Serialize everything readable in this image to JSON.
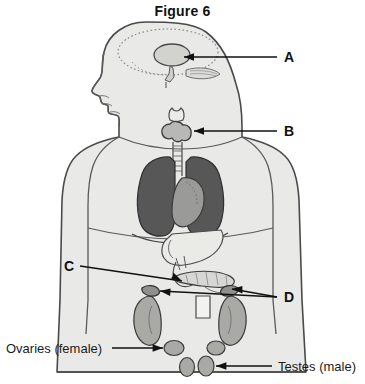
{
  "figure": {
    "title": "Figure 6"
  },
  "labels": {
    "a": {
      "text": "A",
      "target": "pituitary-gland"
    },
    "b": {
      "text": "B",
      "target": "thyroid-gland"
    },
    "c": {
      "text": "C",
      "target": "pancreas"
    },
    "d": {
      "text": "D",
      "target": "adrenal-glands"
    },
    "ovaries": {
      "text": "Ovaries (female)",
      "target": "ovaries"
    },
    "testes": {
      "text": "Testes (male)",
      "target": "testes"
    }
  },
  "colors": {
    "background": "#ffffff",
    "body_fill": "#e9e9e7",
    "body_stroke": "#4a4a4a",
    "organ_light": "#d7d7d4",
    "organ_mid": "#a9a9a6",
    "lung_dark": "#575757",
    "heart_gray": "#9a9a98",
    "line": "#111111",
    "text": "#1a1a1a"
  },
  "organs": [
    {
      "name": "brain-outline",
      "label_ref": null
    },
    {
      "name": "pituitary-gland",
      "label_ref": "A"
    },
    {
      "name": "hypothalamus",
      "label_ref": null
    },
    {
      "name": "thyroid-gland",
      "label_ref": "B"
    },
    {
      "name": "trachea",
      "label_ref": null
    },
    {
      "name": "lung-left",
      "label_ref": null
    },
    {
      "name": "lung-right",
      "label_ref": null
    },
    {
      "name": "heart",
      "label_ref": null
    },
    {
      "name": "stomach",
      "label_ref": null
    },
    {
      "name": "pancreas",
      "label_ref": "C"
    },
    {
      "name": "adrenal-gland-left",
      "label_ref": "D"
    },
    {
      "name": "adrenal-gland-right",
      "label_ref": "D"
    },
    {
      "name": "kidney-left",
      "label_ref": null
    },
    {
      "name": "kidney-right",
      "label_ref": null
    },
    {
      "name": "ovaries",
      "label_ref": "Ovaries (female)"
    },
    {
      "name": "testes",
      "label_ref": "Testes (male)"
    }
  ]
}
